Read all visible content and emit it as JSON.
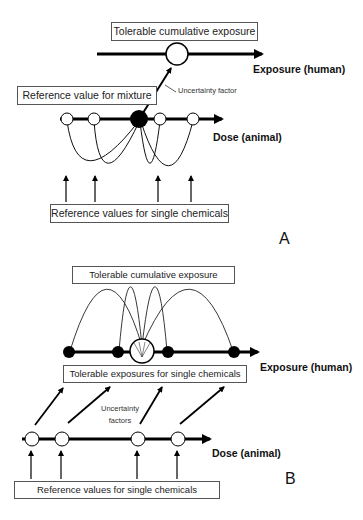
{
  "panel_a": {
    "letter": "A",
    "top_box": "Tolerable cumulative exposure",
    "human_axis_label": "Exposure (human)",
    "uncertainty_label": "Uncertainty factor",
    "mixture_box": "Reference value for mixture",
    "animal_axis_label": "Dose (animal)",
    "bottom_box": "Reference values for single chemicals"
  },
  "panel_b": {
    "letter": "B",
    "top_box": "Tolerable cumulative exposure",
    "human_axis_label": "Exposure (human)",
    "single_exposures_box": "Tolerable exposures for single chemicals",
    "uncertainty_label_line1": "Uncertainty",
    "uncertainty_label_line2": "factors",
    "animal_axis_label": "Dose (animal)",
    "bottom_box": "Reference values for single chemicals"
  }
}
